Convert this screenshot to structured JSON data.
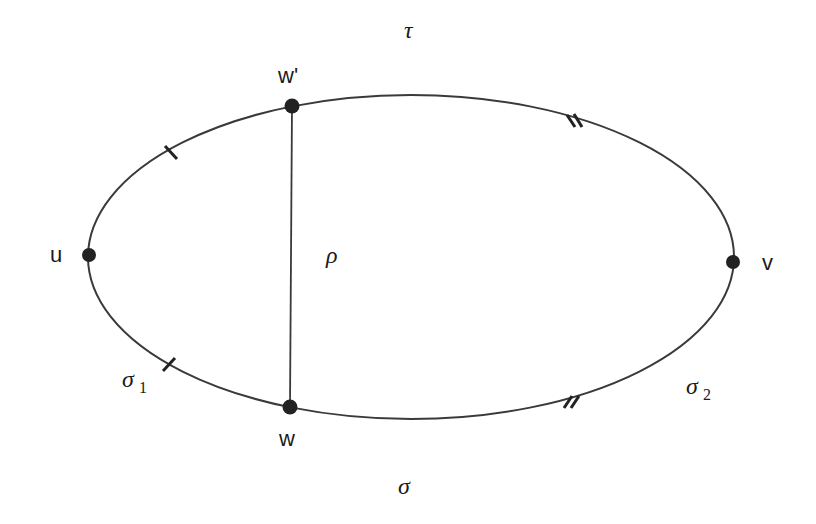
{
  "diagram": {
    "colors": {
      "stroke": "#3a3a3a",
      "node": "#222222",
      "text": "#1a1a1a",
      "background": "#ffffff"
    },
    "cycle": {
      "cx": 411,
      "cy": 257,
      "rx": 323,
      "ry": 162
    },
    "nodes": [
      {
        "id": "u",
        "label": "u",
        "x": 89,
        "y": 255
      },
      {
        "id": "v",
        "label": "v",
        "x": 733,
        "y": 262
      },
      {
        "id": "w_prime",
        "label": "w'",
        "x": 292,
        "y": 106
      },
      {
        "id": "w",
        "label": "w",
        "x": 290,
        "y": 407
      }
    ],
    "chord": {
      "from": "w_prime",
      "to": "w",
      "label": "ρ"
    },
    "path_labels": {
      "tau": "τ",
      "sigma": "σ",
      "rho": "ρ",
      "sigma1": {
        "base": "σ",
        "sub": "1"
      },
      "sigma2": {
        "base": "σ",
        "sub": "2"
      }
    },
    "tick_marks": [
      {
        "position": "upper-left",
        "count": 1
      },
      {
        "position": "lower-left",
        "count": 1
      },
      {
        "position": "upper-right",
        "count": 2
      },
      {
        "position": "lower-right",
        "count": 2
      }
    ]
  }
}
